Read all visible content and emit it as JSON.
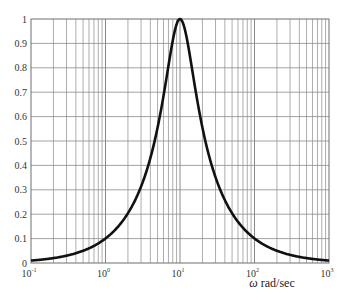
{
  "chart_data": {
    "type": "line",
    "title": "",
    "xlabel": "ω rad/sec",
    "xlabel_symbol": "ω",
    "xlabel_unit": "rad/sec",
    "ylabel": "",
    "xscale": "log",
    "xlim": [
      0.1,
      1000
    ],
    "ylim": [
      0,
      1
    ],
    "grid": true,
    "x_ticks": [
      {
        "value": 0.1,
        "base": "10",
        "exp": "-1"
      },
      {
        "value": 1,
        "base": "10",
        "exp": "0"
      },
      {
        "value": 10,
        "base": "10",
        "exp": "1"
      },
      {
        "value": 100,
        "base": "10",
        "exp": "2"
      },
      {
        "value": 1000,
        "base": "10",
        "exp": "3"
      }
    ],
    "y_ticks": [
      "0",
      "0.1",
      "0.2",
      "0.3",
      "0.4",
      "0.5",
      "0.6",
      "0.7",
      "0.8",
      "0.9",
      "1"
    ],
    "series": [
      {
        "name": "magnitude",
        "color": "#111111",
        "x": [
          0.1,
          0.2,
          0.5,
          1,
          2,
          3,
          4.2,
          5,
          7,
          10,
          14,
          20,
          23.8,
          30,
          50,
          100,
          200,
          500,
          1000
        ],
        "values": [
          0.01,
          0.02,
          0.05,
          0.1,
          0.204,
          0.314,
          0.5,
          0.555,
          0.826,
          1.0,
          0.826,
          0.555,
          0.5,
          0.351,
          0.204,
          0.1,
          0.05,
          0.02,
          0.01
        ]
      }
    ],
    "model": {
      "omega0": 10,
      "Q": 1
    }
  },
  "colors": {
    "curve": "#111111",
    "grid": "#8a8a8a",
    "axis_text": "#333333"
  }
}
